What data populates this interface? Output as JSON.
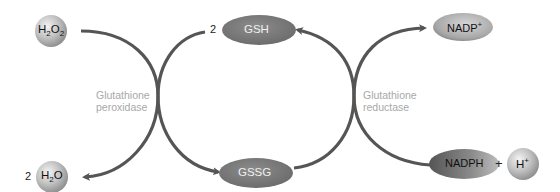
{
  "diagram": {
    "colors": {
      "arrow": "#555555",
      "ellipse_dark": "#777777",
      "ellipse_light": "#bdbdbd",
      "sphere": "#c4c4c4",
      "enzyme_text": "#a8a8a8",
      "background": "#ffffff"
    },
    "nodes": {
      "h2o2": {
        "base": "H",
        "sub1": "2",
        "mid": "O",
        "sub2": "2",
        "display": "H2O2"
      },
      "h2o": {
        "coef": "2",
        "base": "H",
        "sub1": "2",
        "mid": "O",
        "display": "2 H2O"
      },
      "gsh": {
        "coef": "2",
        "label": "GSH"
      },
      "gssg": {
        "label": "GSSG"
      },
      "nadp": {
        "base": "NADP",
        "sup": "+",
        "display": "NADP+"
      },
      "nadph": {
        "label": "NADPH"
      },
      "plus": "+",
      "hplus": {
        "base": "H",
        "sup": "+",
        "display": "H+"
      }
    },
    "enzymes": {
      "peroxidase": {
        "line1": "Glutathione",
        "line2": "peroxidase"
      },
      "reductase": {
        "line1": "Glutathione",
        "line2": "reductase"
      }
    },
    "edges": [
      {
        "from": "H2O2",
        "to": "H2O",
        "via": "Glutathione peroxidase"
      },
      {
        "from": "GSH",
        "to": "GSSG",
        "via": "Glutathione peroxidase"
      },
      {
        "from": "GSSG",
        "to": "GSH",
        "via": "Glutathione reductase"
      },
      {
        "from": "NADPH",
        "to": "NADP+",
        "via": "Glutathione reductase"
      }
    ]
  }
}
